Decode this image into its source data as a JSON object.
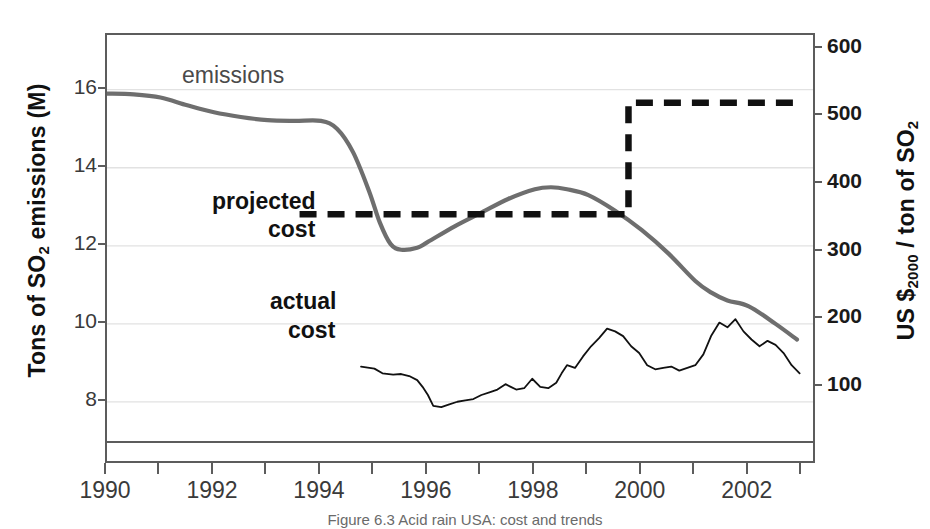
{
  "figure": {
    "caption": "Figure 6.3 Acid rain USA: cost and trends"
  },
  "annotations": {
    "emissions": "emissions",
    "projected_cost_line1": "projected",
    "projected_cost_line2": "cost",
    "actual_cost_line1": "actual",
    "actual_cost_line2": "cost"
  },
  "axes": {
    "left": {
      "title_prefix": "Tons of SO",
      "title_sub": "2",
      "title_suffix": " emissions (M)",
      "ticks": [
        "8",
        "10",
        "12",
        "14",
        "16"
      ],
      "min": 7.0,
      "max": 17.4
    },
    "right": {
      "title_prefix": "US $",
      "title_sub": "2000",
      "title_suffix": " / ton of SO",
      "title_sub2": "2",
      "ticks": [
        "100",
        "200",
        "300",
        "400",
        "500",
        "600"
      ],
      "min": 20,
      "max": 620
    },
    "x": {
      "ticks": [
        "1990",
        "1992",
        "1994",
        "1996",
        "1998",
        "2000",
        "2002"
      ],
      "min": 1990,
      "max": 2003.2
    }
  },
  "colors": {
    "emissions": "#6e6e6e",
    "projected_cost": "#111111",
    "actual_cost": "#111111",
    "frame": "#5c5c5c",
    "grid": "#e2e2e2",
    "text": "#3a3a3a"
  },
  "chart_data": {
    "type": "line",
    "title": "",
    "xlabel": "",
    "ylabel": "Tons of SO2 emissions (M)",
    "ylabel_right": "US $2000 / ton of SO2",
    "xlim": [
      1990,
      2003.2
    ],
    "ylim": [
      7.0,
      17.4
    ],
    "ylim_right": [
      20,
      620
    ],
    "grid": true,
    "legend": "inline-annotations",
    "series": [
      {
        "name": "emissions",
        "axis": "left",
        "unit": "million tons SO2",
        "style": "solid-thick-grey",
        "x": [
          1990.0,
          1990.5,
          1991.0,
          1991.5,
          1992.0,
          1992.5,
          1993.0,
          1993.5,
          1994.0,
          1994.3,
          1994.6,
          1994.9,
          1995.1,
          1995.3,
          1995.5,
          1995.8,
          1996.0,
          1996.5,
          1997.0,
          1997.5,
          1998.0,
          1998.3,
          1998.6,
          1999.0,
          1999.5,
          2000.0,
          2000.5,
          2001.0,
          2001.3,
          2001.6,
          2002.0,
          2002.5,
          2002.9
        ],
        "y": [
          15.9,
          15.88,
          15.8,
          15.6,
          15.42,
          15.3,
          15.22,
          15.2,
          15.2,
          15.0,
          14.4,
          13.4,
          12.6,
          12.05,
          11.9,
          11.95,
          12.1,
          12.5,
          12.85,
          13.2,
          13.45,
          13.5,
          13.45,
          13.3,
          12.9,
          12.4,
          11.8,
          11.1,
          10.8,
          10.6,
          10.45,
          10.0,
          9.6
        ]
      },
      {
        "name": "projected cost",
        "axis": "right",
        "unit": "US $2000 per ton SO2",
        "style": "dashed-thick-black-step",
        "x": [
          1993.6,
          1999.75,
          1999.75,
          2002.95
        ],
        "y": [
          355,
          355,
          520,
          520
        ]
      },
      {
        "name": "actual cost",
        "axis": "right",
        "unit": "US $2000 per ton SO2",
        "style": "thin-black",
        "x": [
          1994.75,
          1995.0,
          1995.15,
          1995.35,
          1995.5,
          1995.65,
          1995.8,
          1995.9,
          1996.0,
          1996.1,
          1996.25,
          1996.4,
          1996.55,
          1996.7,
          1996.85,
          1997.0,
          1997.15,
          1997.3,
          1997.45,
          1997.55,
          1997.65,
          1997.8,
          1997.95,
          1998.1,
          1998.25,
          1998.4,
          1998.5,
          1998.6,
          1998.75,
          1998.9,
          1999.05,
          1999.2,
          1999.35,
          1999.5,
          1999.65,
          1999.8,
          1999.95,
          2000.1,
          2000.25,
          2000.4,
          2000.55,
          2000.7,
          2000.85,
          2001.0,
          2001.15,
          2001.3,
          2001.45,
          2001.6,
          2001.75,
          2001.9,
          2002.05,
          2002.2,
          2002.35,
          2002.5,
          2002.65,
          2002.8,
          2002.95
        ],
        "y": [
          130,
          127,
          120,
          118,
          119,
          116,
          110,
          100,
          88,
          72,
          70,
          74,
          78,
          80,
          82,
          88,
          92,
          96,
          104,
          100,
          96,
          98,
          112,
          100,
          98,
          106,
          120,
          132,
          128,
          145,
          160,
          172,
          186,
          182,
          175,
          160,
          150,
          132,
          126,
          128,
          130,
          124,
          128,
          132,
          148,
          176,
          195,
          188,
          200,
          182,
          170,
          160,
          168,
          162,
          150,
          132,
          120
        ]
      }
    ]
  }
}
